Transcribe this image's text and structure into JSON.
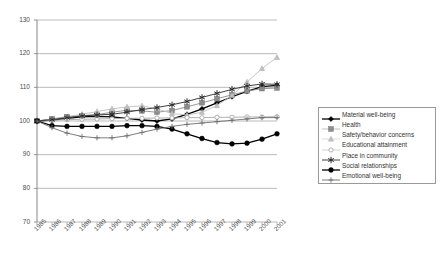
{
  "chart_data": {
    "type": "line",
    "title": "",
    "xlabel": "",
    "ylabel": "",
    "ylim": [
      70,
      130
    ],
    "yticks": [
      70,
      80,
      90,
      100,
      110,
      120,
      130
    ],
    "grid": true,
    "legend_position": "right",
    "x": [
      "1985",
      "1986",
      "1987",
      "1988",
      "1989",
      "1990",
      "1991",
      "1992",
      "1993",
      "1994",
      "1995",
      "1996",
      "1997",
      "1998",
      "1999",
      "2000",
      "2001"
    ],
    "series": [
      {
        "name": "Material well-being",
        "color": "#000000",
        "marker": "diamond",
        "values": [
          100.0,
          100.3,
          100.8,
          101.2,
          101.4,
          101.2,
          100.8,
          100.3,
          100.0,
          100.6,
          102.0,
          103.6,
          105.4,
          107.2,
          108.8,
          110.2,
          110.6
        ]
      },
      {
        "name": "Health",
        "color": "#8c8c8c",
        "marker": "square",
        "values": [
          100.0,
          100.6,
          101.3,
          101.6,
          101.9,
          102.6,
          103.2,
          103.0,
          102.6,
          103.1,
          104.2,
          105.4,
          106.6,
          107.8,
          108.9,
          109.6,
          109.8
        ]
      },
      {
        "name": "Safety/behavior concerns",
        "color": "#c0c0c0",
        "marker": "triangle",
        "values": [
          100.0,
          100.4,
          101.2,
          102.0,
          102.8,
          103.6,
          104.2,
          104.5,
          103.6,
          102.2,
          101.8,
          102.6,
          104.6,
          107.6,
          111.6,
          115.6,
          118.9
        ]
      },
      {
        "name": "Educational attainment",
        "color": "#a8a8a8",
        "marker": "circle-open",
        "values": [
          100.0,
          100.2,
          100.4,
          100.5,
          100.6,
          100.7,
          100.8,
          100.8,
          100.9,
          100.9,
          101.0,
          101.0,
          101.1,
          101.1,
          101.2,
          101.2,
          101.3
        ]
      },
      {
        "name": "Place in community",
        "color": "#2b2b2b",
        "marker": "asterisk",
        "values": [
          100.0,
          100.4,
          101.0,
          101.5,
          101.8,
          102.0,
          102.6,
          103.4,
          104.0,
          104.8,
          105.8,
          107.0,
          108.2,
          109.4,
          110.4,
          111.0,
          110.9
        ]
      },
      {
        "name": "Social relationships",
        "color": "#000000",
        "marker": "circle-filled",
        "values": [
          100.0,
          98.6,
          98.4,
          98.4,
          98.4,
          98.4,
          98.6,
          98.6,
          98.4,
          97.6,
          96.2,
          94.8,
          93.6,
          93.2,
          93.4,
          94.6,
          96.2
        ]
      },
      {
        "name": "Emotional well-being",
        "color": "#6e6e6e",
        "marker": "plus",
        "values": [
          100.0,
          98.0,
          96.4,
          95.4,
          95.0,
          95.0,
          95.6,
          96.6,
          97.6,
          98.4,
          99.0,
          99.4,
          99.8,
          100.2,
          100.6,
          101.0,
          101.0
        ]
      }
    ]
  }
}
